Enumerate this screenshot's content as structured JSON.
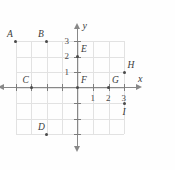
{
  "chart_data": {
    "type": "scatter",
    "title": "",
    "xlabel": "x",
    "ylabel": "y",
    "xlim": [
      -4,
      3
    ],
    "ylim": [
      -3,
      3
    ],
    "grid": true,
    "legend": "none",
    "x_tick_labels": [
      "1",
      "2",
      "3"
    ],
    "x_tick_values": [
      1,
      2,
      3
    ],
    "y_tick_labels": [
      "1",
      "2",
      "3"
    ],
    "y_tick_values": [
      1,
      2,
      3
    ],
    "points": [
      {
        "label": "A",
        "x": -4,
        "y": 3,
        "label_pos": "above-left"
      },
      {
        "label": "B",
        "x": -2,
        "y": 3,
        "label_pos": "above-left"
      },
      {
        "label": "C",
        "x": -3,
        "y": 0,
        "label_pos": "above-left"
      },
      {
        "label": "D",
        "x": -2,
        "y": -3,
        "label_pos": "above-left"
      },
      {
        "label": "E",
        "x": 0,
        "y": 2,
        "label_pos": "above-right"
      },
      {
        "label": "F",
        "x": 0,
        "y": 0,
        "label_pos": "above-right"
      },
      {
        "label": "G",
        "x": 2,
        "y": 0,
        "label_pos": "above-right"
      },
      {
        "label": "H",
        "x": 3,
        "y": 1,
        "label_pos": "above-right"
      },
      {
        "label": "I",
        "x": 3,
        "y": -1,
        "label_pos": "below-right"
      }
    ]
  },
  "axes": {
    "x_axis_name": "x",
    "y_axis_name": "y"
  },
  "colors": {
    "grid": "#e2e2e2",
    "axis": "#888888",
    "point": "#4a4a4a",
    "text": "#3a3a3a",
    "background": "#fefefe"
  }
}
